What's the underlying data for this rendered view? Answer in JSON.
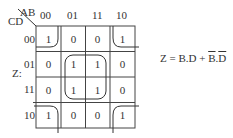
{
  "kmap": {
    "col_var": "AB",
    "row_var": "CD",
    "output_label": "Z:",
    "col_headers": [
      "00",
      "01",
      "11",
      "10"
    ],
    "row_headers": [
      "00",
      "01",
      "11",
      "10"
    ],
    "rows": [
      [
        "1",
        "0",
        "0",
        "1"
      ],
      [
        "0",
        "1",
        "1",
        "0"
      ],
      [
        "0",
        "1",
        "1",
        "0"
      ],
      [
        "1",
        "0",
        "0",
        "1"
      ]
    ],
    "groups": [
      {
        "name": "center-quad",
        "term": "B.D",
        "cells": [
          [
            1,
            1
          ],
          [
            1,
            2
          ],
          [
            2,
            1
          ],
          [
            2,
            2
          ]
        ]
      },
      {
        "name": "corners",
        "term": "B̄.D̄",
        "cells": [
          [
            0,
            0
          ],
          [
            0,
            3
          ],
          [
            3,
            0
          ],
          [
            3,
            3
          ]
        ]
      }
    ]
  },
  "formula": {
    "lhs": "Z = ",
    "term1": "B.D",
    "plus": " + ",
    "term2_b": "B",
    "dot": ".",
    "term2_d": "D",
    "full": "Z = B.D + B̄.D̄"
  }
}
